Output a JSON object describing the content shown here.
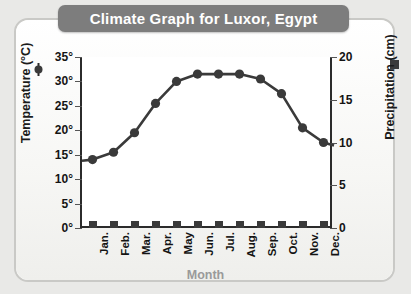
{
  "title": "Climate Graph for Luxor, Egypt",
  "axes": {
    "left_title": "Temperature (°C)",
    "right_title": "Precipitation (cm)",
    "x_title": "Month",
    "left_ticks": [
      "35°",
      "30°",
      "25°",
      "20°",
      "15°",
      "10°",
      "5°",
      "0°"
    ],
    "right_ticks": [
      "20",
      "15",
      "10",
      "5",
      "0"
    ]
  },
  "legend": {
    "temperature_marker": "circle-line-marker",
    "precipitation_marker": "filled-square-marker"
  },
  "chart_data": {
    "type": "line",
    "title": "Climate Graph for Luxor, Egypt",
    "xlabel": "Month",
    "ylabel": "Temperature (°C)",
    "y2label": "Precipitation (cm)",
    "categories": [
      "Jan.",
      "Feb.",
      "Mar.",
      "Apr.",
      "May",
      "Jun.",
      "Jul.",
      "Aug.",
      "Sep.",
      "Oct.",
      "Nov.",
      "Dec."
    ],
    "ylim": [
      0,
      35
    ],
    "y2lim": [
      0,
      20
    ],
    "grid": false,
    "legend_position": "axis-titles",
    "series": [
      {
        "name": "Temperature (°C)",
        "type": "line",
        "axis": "left",
        "color": "#3a3a3a",
        "values": [
          14,
          15.5,
          19.5,
          25.5,
          30,
          31.5,
          31.5,
          31.5,
          30.5,
          27.5,
          20.5,
          17.5
        ]
      },
      {
        "name": "Precipitation (cm)",
        "type": "bar",
        "axis": "right",
        "color": "#3a3a3a",
        "values": [
          0,
          0,
          0,
          0,
          0,
          0,
          0,
          0,
          0,
          0,
          0,
          0
        ]
      }
    ]
  }
}
